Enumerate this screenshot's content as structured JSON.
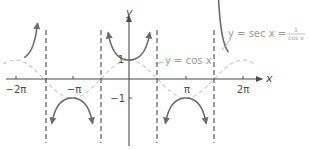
{
  "chart_data": {
    "type": "line",
    "title": "",
    "xlabel": "x",
    "ylabel": "y",
    "xlim": [
      -7.2,
      8.2
    ],
    "ylim": [
      -3.6,
      4.1
    ],
    "grid": false,
    "x_ticks": [
      {
        "value": -6.2832,
        "label": "−2π"
      },
      {
        "value": -3.1416,
        "label": "−π"
      },
      {
        "value": 3.1416,
        "label": "π"
      },
      {
        "value": 6.2832,
        "label": "2π"
      }
    ],
    "y_ticks": [
      {
        "value": 1,
        "label": "1"
      },
      {
        "value": -1,
        "label": "−1"
      }
    ],
    "asymptotes_x": [
      -4.7124,
      -1.5708,
      1.5708,
      4.7124
    ],
    "series": [
      {
        "name": "y = sec x = 1/cos x",
        "function": "sec(x)",
        "style": "solid",
        "color": "#6b6b6b",
        "domain": [
          -5.5,
          5.5
        ]
      },
      {
        "name": "y = cos x",
        "function": "cos(x)",
        "style": "dashed",
        "color": "#c8c8c8",
        "domain": [
          -7.0,
          7.0
        ]
      }
    ],
    "annotations": [
      {
        "text": "y = sec x = 1/cos x",
        "points_to": "sec curve near x = 3π/2"
      },
      {
        "text": "y = cos x",
        "points_to": "cos curve near x = π/2"
      }
    ]
  },
  "labels": {
    "x_axis": "x",
    "y_axis": "y",
    "tick_neg2pi": "−2π",
    "tick_negpi": "−π",
    "tick_pi": "π",
    "tick_2pi": "2π",
    "tick_y1": "1",
    "tick_yneg1": "−1",
    "sec_label_lhs": "y = sec x =",
    "sec_label_num": "1",
    "sec_label_den": "cos x",
    "cos_label": "y = cos x"
  },
  "colors": {
    "axis": "#4a4a4a",
    "sec_curve": "#6b6b6b",
    "cos_curve": "#c8c8c8",
    "asymptote": "#4a4a4a",
    "label_text": "#9a9a9a"
  }
}
